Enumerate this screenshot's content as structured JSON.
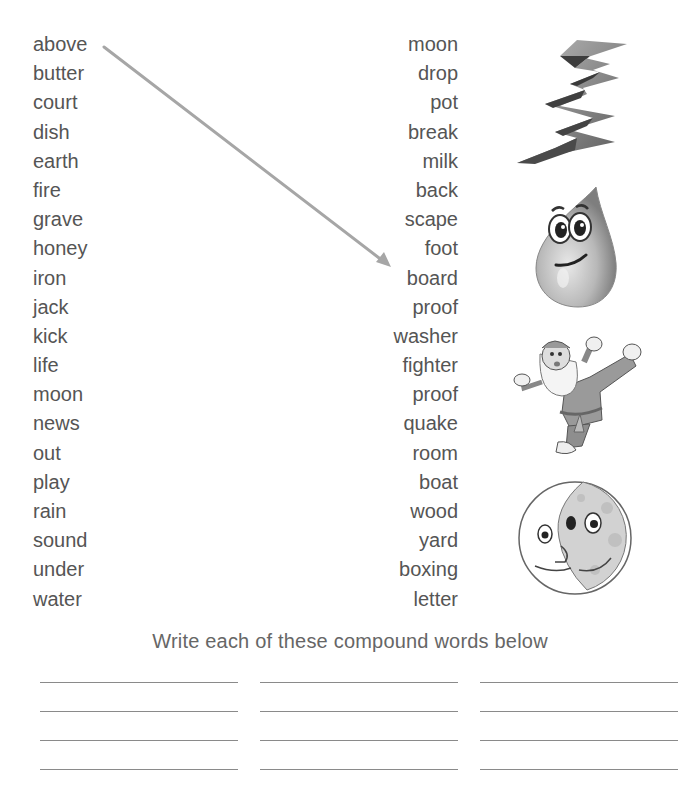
{
  "worksheet": {
    "left_words": [
      "above",
      "butter",
      "court",
      "dish",
      "earth",
      "fire",
      "grave",
      "honey",
      "iron",
      "jack",
      "kick",
      "life",
      "moon",
      "news",
      "out",
      "play",
      "rain",
      "sound",
      "under",
      "water"
    ],
    "right_words": [
      "moon",
      "drop",
      "pot",
      "break",
      "milk",
      "back",
      "scape",
      "foot",
      "board",
      "proof",
      "washer",
      "fighter",
      "proof",
      "quake",
      "room",
      "boat",
      "wood",
      "yard",
      "boxing",
      "letter"
    ],
    "example_arrow": {
      "from": "above",
      "to": "board",
      "color": "#a6a6a6"
    },
    "pictures": [
      "earthquake-crack-icon",
      "raindrop-icon",
      "kickboxing-santa-icon",
      "moon-face-icon"
    ],
    "instruction": "Write each of these compound words below",
    "answer_lines": {
      "rows": 4,
      "columns": 3
    }
  }
}
